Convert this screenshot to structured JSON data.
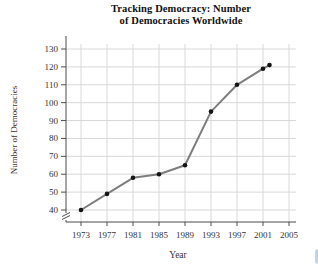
{
  "figure": {
    "title_line1": "Tracking Democracy: Number",
    "title_line2": "of Democracies Worldwide"
  },
  "chart_data": {
    "type": "line",
    "title": "Tracking Democracy: Number of Democracies Worldwide",
    "x": [
      1973,
      1977,
      1981,
      1985,
      1989,
      1993,
      1997,
      2001,
      2002
    ],
    "values": [
      40,
      49,
      58,
      60,
      65,
      95,
      110,
      119,
      121
    ],
    "xlabel": "Year",
    "ylabel": "Number of Democracies",
    "xticks": [
      1973,
      1977,
      1981,
      1985,
      1989,
      1993,
      1997,
      2001,
      2005
    ],
    "yticks": [
      40,
      50,
      60,
      70,
      80,
      90,
      100,
      110,
      120,
      130
    ],
    "xlim": [
      1971,
      2006
    ],
    "ylim": [
      40,
      130
    ],
    "axis_break": true,
    "grid": true,
    "legend": false,
    "marker": "filled-circle",
    "colors": {
      "line": "#7d7d7d",
      "marker": "#141414",
      "grid": "#d8d8d8",
      "axis": "#4d4d4d",
      "text": "#333333",
      "edge_artifact": "#b3cfe6"
    }
  }
}
